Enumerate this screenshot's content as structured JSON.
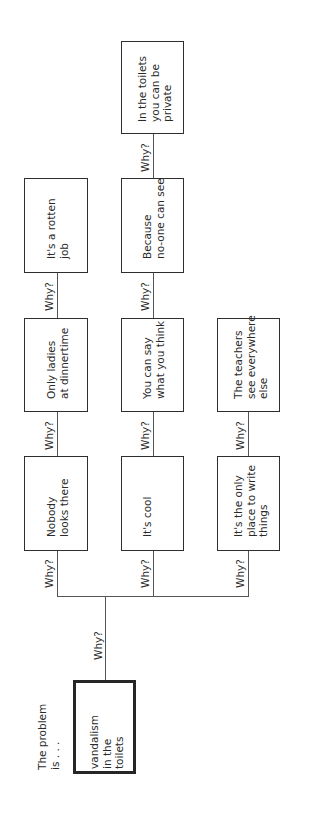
{
  "intro_label": "The problem\nis . . .",
  "problem": "vandalism\nin the\ntoilets",
  "why_label": "Why?",
  "branches": [
    {
      "nodes": [
        "Nobody\nlooks there",
        "Only ladies\nat dinnertime",
        "It's a rotten\njob"
      ]
    },
    {
      "nodes": [
        "It's cool",
        "You can say\nwhat you think",
        "Because\nno-one can see",
        "In the toilets\nyou can be\nprivate"
      ]
    },
    {
      "nodes": [
        "It's the only\nplace to write\nthings",
        "The teachers\nsee everywhere\nelse"
      ]
    }
  ],
  "colors": {
    "line": "#555555",
    "border": "#2e2e2e",
    "text": "#2a2a2a",
    "background": "#ffffff"
  }
}
